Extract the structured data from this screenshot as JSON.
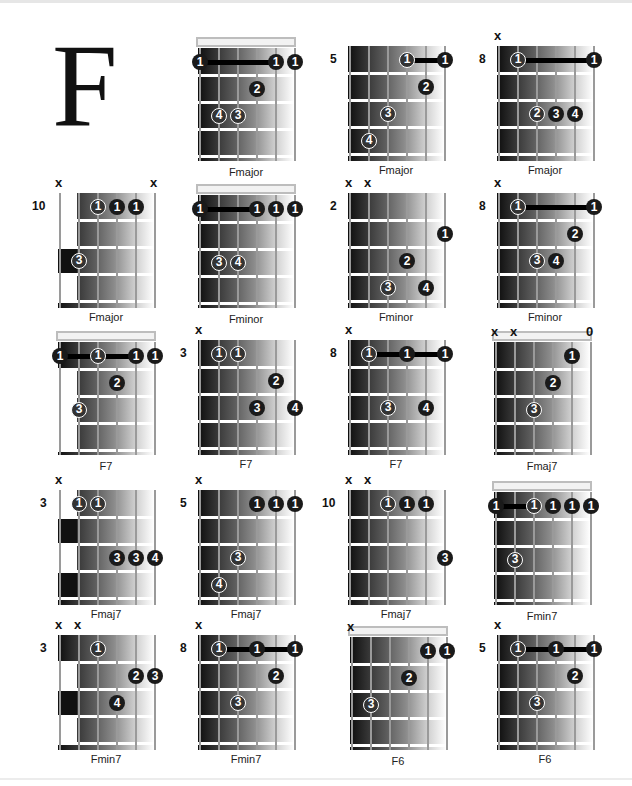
{
  "page": {
    "title_letter": "F"
  },
  "chords": [
    {
      "name": "Fmajor",
      "x": 198,
      "y": 38,
      "nut": true,
      "fret": null,
      "muted": [],
      "open": [],
      "dots": [
        [
          0,
          1,
          "1"
        ],
        [
          4,
          1,
          "1"
        ],
        [
          5,
          1,
          "1"
        ],
        [
          3,
          2,
          "2"
        ],
        [
          1,
          3,
          "4"
        ],
        [
          2,
          3,
          "3"
        ]
      ],
      "barre": [
        0,
        4,
        1
      ]
    },
    {
      "name": "Fmajor",
      "x": 348,
      "y": 46,
      "nut": false,
      "fret": "5",
      "muted": [],
      "open": [],
      "dots": [
        [
          3,
          1,
          "1"
        ],
        [
          5,
          1,
          "1"
        ],
        [
          4,
          2,
          "2"
        ],
        [
          2,
          3,
          "3"
        ],
        [
          1,
          4,
          "4"
        ]
      ],
      "barre": [
        3,
        5,
        1
      ]
    },
    {
      "name": "Fmajor",
      "x": 497,
      "y": 46,
      "nut": false,
      "fret": "8",
      "muted": [
        0
      ],
      "open": [],
      "dots": [
        [
          1,
          1,
          "1"
        ],
        [
          5,
          1,
          "1"
        ],
        [
          2,
          3,
          "2"
        ],
        [
          3,
          3,
          "3"
        ],
        [
          4,
          3,
          "4"
        ]
      ],
      "barre": [
        1,
        5,
        1
      ]
    },
    {
      "name": "Fmajor",
      "x": 58,
      "y": 193,
      "nut": false,
      "fret": "10",
      "muted": [
        0,
        5
      ],
      "open": [],
      "dots": [
        [
          2,
          1,
          "1"
        ],
        [
          3,
          1,
          "1"
        ],
        [
          4,
          1,
          "1"
        ],
        [
          1,
          3,
          "3"
        ]
      ],
      "barre": null,
      "partial": "fmajor10"
    },
    {
      "name": "Fminor",
      "x": 198,
      "y": 185,
      "nut": true,
      "fret": null,
      "muted": [],
      "open": [],
      "dots": [
        [
          0,
          1,
          "1"
        ],
        [
          3,
          1,
          "1"
        ],
        [
          4,
          1,
          "1"
        ],
        [
          5,
          1,
          "1"
        ],
        [
          1,
          3,
          "3"
        ],
        [
          2,
          3,
          "4"
        ]
      ],
      "barre": [
        0,
        3,
        1
      ]
    },
    {
      "name": "Fminor",
      "x": 348,
      "y": 193,
      "nut": false,
      "fret": "2",
      "muted": [
        0,
        1
      ],
      "open": [],
      "dots": [
        [
          5,
          2,
          "1"
        ],
        [
          3,
          3,
          "2"
        ],
        [
          2,
          4,
          "3"
        ],
        [
          4,
          4,
          "4"
        ]
      ],
      "barre": null
    },
    {
      "name": "Fminor",
      "x": 497,
      "y": 193,
      "nut": false,
      "fret": "8",
      "muted": [
        0
      ],
      "open": [],
      "dots": [
        [
          1,
          1,
          "1"
        ],
        [
          5,
          1,
          "1"
        ],
        [
          4,
          2,
          "2"
        ],
        [
          2,
          3,
          "3"
        ],
        [
          3,
          3,
          "4"
        ]
      ],
      "barre": [
        1,
        5,
        1
      ]
    },
    {
      "name": "F7",
      "x": 58,
      "y": 332,
      "nut": true,
      "fret": null,
      "muted": [],
      "open": [],
      "dots": [
        [
          0,
          1,
          "1"
        ],
        [
          2,
          1,
          "1"
        ],
        [
          4,
          1,
          "1"
        ],
        [
          5,
          1,
          "1"
        ],
        [
          3,
          2,
          "2"
        ],
        [
          1,
          3,
          "3"
        ]
      ],
      "barre": [
        0,
        4,
        1
      ],
      "partial": "f7open"
    },
    {
      "name": "F7",
      "x": 198,
      "y": 340,
      "nut": false,
      "fret": "3",
      "muted": [
        0
      ],
      "open": [],
      "dots": [
        [
          1,
          1,
          "1"
        ],
        [
          2,
          1,
          "1"
        ],
        [
          4,
          2,
          "2"
        ],
        [
          3,
          3,
          "3"
        ],
        [
          5,
          3,
          "4"
        ]
      ],
      "barre": null
    },
    {
      "name": "F7",
      "x": 348,
      "y": 340,
      "nut": false,
      "fret": "8",
      "muted": [
        0
      ],
      "open": [],
      "dots": [
        [
          1,
          1,
          "1"
        ],
        [
          3,
          1,
          "1"
        ],
        [
          5,
          1,
          "1"
        ],
        [
          2,
          3,
          "3"
        ],
        [
          4,
          3,
          "4"
        ]
      ],
      "barre": [
        1,
        5,
        1
      ]
    },
    {
      "name": "Fmaj7",
      "x": 494,
      "y": 332,
      "nut": true,
      "fret": null,
      "muted": [
        0,
        1
      ],
      "open": [
        5
      ],
      "dots": [
        [
          4,
          1,
          "1"
        ],
        [
          3,
          2,
          "2"
        ],
        [
          2,
          3,
          "3"
        ]
      ],
      "barre": null
    },
    {
      "name": "Fmaj7",
      "x": 58,
      "y": 490,
      "nut": false,
      "fret": "3",
      "muted": [
        0
      ],
      "open": [],
      "dots": [
        [
          1,
          1,
          "1"
        ],
        [
          2,
          1,
          "1"
        ],
        [
          3,
          3,
          "3"
        ],
        [
          4,
          3,
          "3"
        ],
        [
          5,
          3,
          "4"
        ]
      ],
      "barre": null,
      "partial": "fmaj7_3"
    },
    {
      "name": "Fmaj7",
      "x": 198,
      "y": 490,
      "nut": false,
      "fret": "5",
      "muted": [
        0
      ],
      "open": [],
      "dots": [
        [
          3,
          1,
          "1"
        ],
        [
          4,
          1,
          "1"
        ],
        [
          5,
          1,
          "1"
        ],
        [
          2,
          3,
          "3"
        ],
        [
          1,
          4,
          "4"
        ]
      ],
      "barre": null
    },
    {
      "name": "Fmaj7",
      "x": 348,
      "y": 490,
      "nut": false,
      "fret": "10",
      "muted": [
        0,
        1
      ],
      "open": [],
      "dots": [
        [
          2,
          1,
          "1"
        ],
        [
          3,
          1,
          "1"
        ],
        [
          4,
          1,
          "1"
        ],
        [
          5,
          3,
          "3"
        ]
      ],
      "barre": null
    },
    {
      "name": "Fmin7",
      "x": 494,
      "y": 482,
      "nut": true,
      "fret": null,
      "muted": [],
      "open": [],
      "dots": [
        [
          0,
          1,
          "1"
        ],
        [
          2,
          1,
          "1"
        ],
        [
          3,
          1,
          "1"
        ],
        [
          4,
          1,
          "1"
        ],
        [
          5,
          1,
          "1"
        ],
        [
          1,
          3,
          "3"
        ]
      ],
      "barre": [
        0,
        2,
        1
      ]
    },
    {
      "name": "Fmin7",
      "x": 58,
      "y": 635,
      "nut": false,
      "fret": "3",
      "muted": [
        0,
        1
      ],
      "open": [],
      "dots": [
        [
          2,
          1,
          "1"
        ],
        [
          4,
          2,
          "2"
        ],
        [
          5,
          2,
          "3"
        ],
        [
          3,
          3,
          "4"
        ]
      ],
      "barre": null,
      "partial": "fmin7_3"
    },
    {
      "name": "Fmin7",
      "x": 198,
      "y": 635,
      "nut": false,
      "fret": "8",
      "muted": [
        0
      ],
      "open": [],
      "dots": [
        [
          1,
          1,
          "1"
        ],
        [
          3,
          1,
          "1"
        ],
        [
          5,
          1,
          "1"
        ],
        [
          4,
          2,
          "2"
        ],
        [
          2,
          3,
          "3"
        ]
      ],
      "barre": [
        1,
        5,
        1
      ]
    },
    {
      "name": "F6",
      "x": 350,
      "y": 627,
      "nut": true,
      "fret": null,
      "muted": [
        0
      ],
      "open": [],
      "dots": [
        [
          4,
          1,
          "1"
        ],
        [
          5,
          1,
          "1"
        ],
        [
          3,
          2,
          "2"
        ],
        [
          1,
          3,
          "3"
        ]
      ],
      "barre": null
    },
    {
      "name": "F6",
      "x": 497,
      "y": 635,
      "nut": false,
      "fret": "5",
      "muted": [
        0
      ],
      "open": [],
      "dots": [
        [
          1,
          1,
          "1"
        ],
        [
          3,
          1,
          "1"
        ],
        [
          5,
          1,
          "1"
        ],
        [
          4,
          2,
          "2"
        ],
        [
          2,
          3,
          "3"
        ]
      ],
      "barre": [
        1,
        5,
        1
      ]
    }
  ],
  "symbols": {
    "muted": "x",
    "open": "0"
  }
}
